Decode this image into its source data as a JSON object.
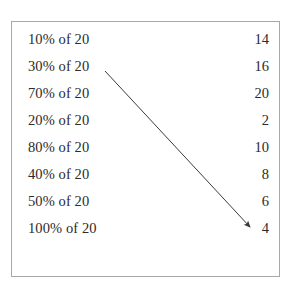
{
  "worksheet": {
    "border_color": "#a8a8a8",
    "text_color": "#2b2b2b",
    "background_color": "#ffffff",
    "rows": [
      {
        "prompt": "10% of 20",
        "answer": "14"
      },
      {
        "prompt": "30% of 20",
        "answer": "16"
      },
      {
        "prompt": "70% of 20",
        "answer": "20"
      },
      {
        "prompt": "20% of 20",
        "answer": "2"
      },
      {
        "prompt": "80% of 20",
        "answer": "10"
      },
      {
        "prompt": "40% of 20",
        "answer": "8"
      },
      {
        "prompt": "50% of 20",
        "answer": "6"
      },
      {
        "prompt": "100% of 20",
        "answer": "4"
      }
    ],
    "arrow": {
      "color": "#3a3a3a",
      "from_label": "30% of 20",
      "to_label": "6",
      "x1": 105,
      "y1": 71,
      "x2": 250,
      "y2": 227
    }
  }
}
